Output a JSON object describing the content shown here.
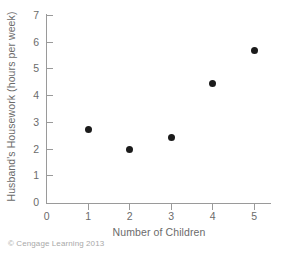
{
  "chart_data": {
    "type": "scatter",
    "title": "",
    "xlabel": "Number of Children",
    "ylabel": "Husband's Housework (hours per week)",
    "x": [
      1,
      2,
      3,
      4,
      5
    ],
    "values": [
      2.72,
      1.97,
      2.42,
      4.45,
      5.68
    ],
    "series": [
      {
        "name": "Husband's Housework",
        "points": [
          {
            "x": 1,
            "y": 2.72
          },
          {
            "x": 2,
            "y": 1.97
          },
          {
            "x": 3,
            "y": 2.42
          },
          {
            "x": 4,
            "y": 4.45
          },
          {
            "x": 5,
            "y": 5.68
          }
        ]
      }
    ],
    "xlim": [
      0,
      5.4
    ],
    "ylim": [
      0,
      7
    ],
    "xticks": [
      0,
      1,
      2,
      3,
      4,
      5
    ],
    "yticks": [
      0,
      1,
      2,
      3,
      4,
      5,
      6,
      7
    ],
    "xticklabels": [
      "0",
      "1",
      "2",
      "3",
      "4",
      "5"
    ],
    "yticklabels": [
      "0",
      "1",
      "2",
      "3",
      "4",
      "5",
      "6",
      "7"
    ],
    "grid": false,
    "legend": null,
    "marker_color": "#1b1b1b",
    "axis_color": "#9a9a9a",
    "text_color": "#6b6b6b"
  },
  "footer": {
    "credit": "© Cengage Learning 2013"
  }
}
